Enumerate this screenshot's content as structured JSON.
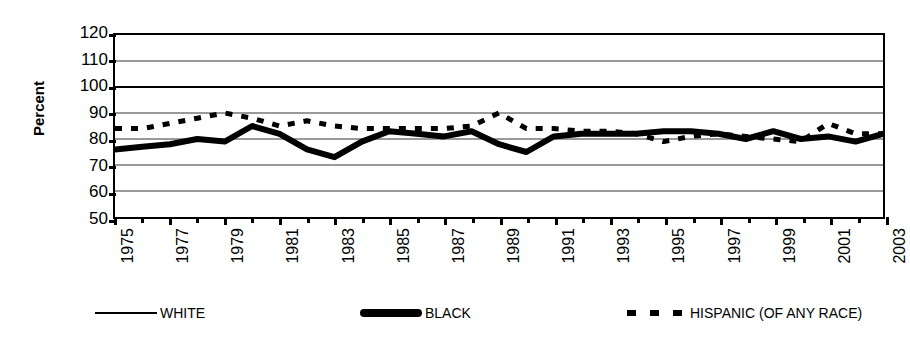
{
  "chart_data": {
    "type": "line",
    "title": "",
    "xlabel": "",
    "ylabel": "Percent",
    "ylim": [
      50,
      120
    ],
    "ytick_step": 10,
    "yticks": [
      120,
      110,
      100,
      90,
      80,
      70,
      60,
      50
    ],
    "xlim": [
      1975,
      2003
    ],
    "x": [
      1975,
      1976,
      1977,
      1978,
      1979,
      1980,
      1981,
      1982,
      1983,
      1984,
      1985,
      1986,
      1987,
      1988,
      1989,
      1990,
      1991,
      1992,
      1993,
      1994,
      1995,
      1996,
      1997,
      1998,
      1999,
      2000,
      2001,
      2002,
      2003
    ],
    "xtick_labels": [
      "1975",
      "",
      "1977",
      "",
      "1979",
      "",
      "1981",
      "",
      "1983",
      "",
      "1985",
      "",
      "1987",
      "",
      "1989",
      "",
      "1991",
      "",
      "1993",
      "",
      "1995",
      "",
      "1997",
      "",
      "1999",
      "",
      "2001",
      "",
      "2003"
    ],
    "grid": true,
    "grid_axis": "y",
    "legend_position": "bottom",
    "series": [
      {
        "name": "WHITE",
        "style": "thin-solid",
        "color": "#000000",
        "values": [
          100,
          100,
          100,
          100,
          100,
          100,
          100,
          100,
          100,
          100,
          100,
          100,
          100,
          100,
          100,
          100,
          100,
          100,
          100,
          100,
          100,
          100,
          100,
          100,
          100,
          100,
          100,
          100,
          100
        ]
      },
      {
        "name": "BLACK",
        "style": "thick-solid",
        "color": "#000000",
        "values": [
          76,
          77,
          78,
          80,
          79,
          85,
          82,
          76,
          73,
          79,
          83,
          82,
          81,
          83,
          78,
          75,
          81,
          82,
          82,
          82,
          83,
          83,
          82,
          80,
          83,
          80,
          81,
          79,
          82
        ]
      },
      {
        "name": "HISPANIC (OF ANY RACE)",
        "style": "dashed",
        "color": "#000000",
        "values": [
          84,
          84,
          86,
          88,
          90,
          88,
          85,
          87,
          85,
          84,
          84,
          84,
          84,
          85,
          90,
          84,
          84,
          83,
          83,
          82,
          79,
          81,
          82,
          81,
          80,
          79,
          86,
          82,
          82
        ]
      }
    ]
  },
  "legend": {
    "items": [
      {
        "label": "WHITE",
        "swatch": "thin-line-swatch"
      },
      {
        "label": "BLACK",
        "swatch": "thick-line-swatch"
      },
      {
        "label": "HISPANIC (OF ANY RACE)",
        "swatch": "dashed-line-swatch"
      }
    ]
  },
  "axis": {
    "y_title": "Percent"
  }
}
